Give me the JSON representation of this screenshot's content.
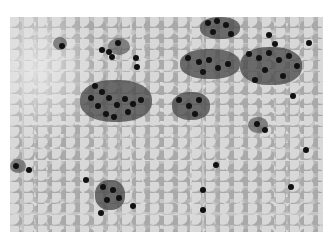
{
  "image": {
    "description": "Grayscale cytology micrograph showing clusters of dark-nucleated cells on a mottled background",
    "colors": {
      "background": "#ffffff",
      "field": "#c4c4c4",
      "nuclei": "#111111",
      "cytoplasm": "#5a5a5a"
    }
  }
}
